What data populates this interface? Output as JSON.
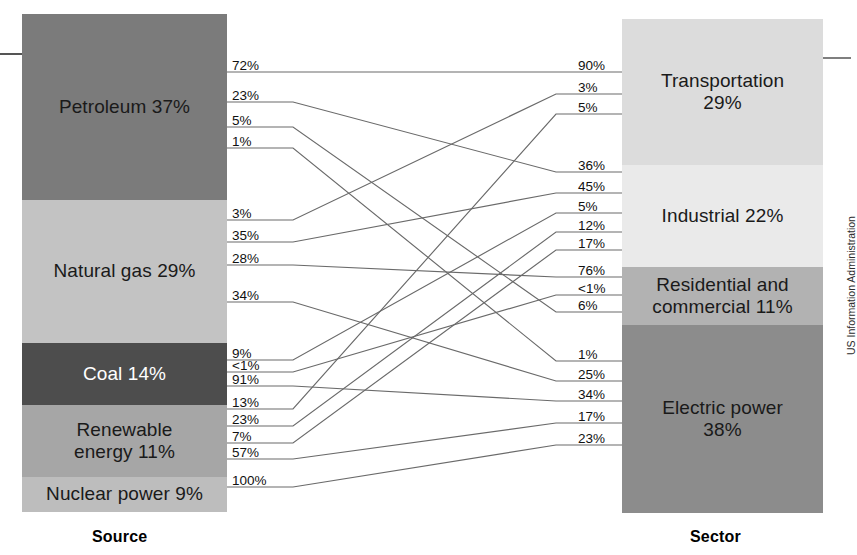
{
  "figure": {
    "source_caption": "Source",
    "sector_caption": "Sector",
    "credit": "US Information Administration"
  },
  "chart_data": {
    "type": "sankey",
    "xlabel": "Source",
    "ylabel": "Sector",
    "legend_position": "none",
    "grid": false,
    "nodes_left": [
      {
        "id": "petroleum",
        "label": "Petroleum 37%",
        "value": 37,
        "color": "#7b7b7b",
        "text_color": "#1a1a1a"
      },
      {
        "id": "natural_gas",
        "label": "Natural gas 29%",
        "value": 29,
        "color": "#c3c3c3",
        "text_color": "#1a1a1a"
      },
      {
        "id": "coal",
        "label": "Coal 14%",
        "value": 14,
        "color": "#4d4d4d",
        "text_color": "#ffffff"
      },
      {
        "id": "renewable",
        "label": "Renewable\nenergy 11%",
        "value": 11,
        "color": "#a6a6a6",
        "text_color": "#1a1a1a"
      },
      {
        "id": "nuclear",
        "label": "Nuclear power 9%",
        "value": 9,
        "color": "#bdbdbd",
        "text_color": "#1a1a1a"
      }
    ],
    "nodes_right": [
      {
        "id": "transportation",
        "label": "Transportation\n29%",
        "value": 29,
        "color": "#dcdcdc",
        "text_color": "#1a1a1a"
      },
      {
        "id": "industrial",
        "label": "Industrial 22%",
        "value": 22,
        "color": "#eaeaea",
        "text_color": "#1a1a1a"
      },
      {
        "id": "residential",
        "label": "Residential and\ncommercial 11%",
        "value": 11,
        "color": "#b2b2b2",
        "text_color": "#1a1a1a"
      },
      {
        "id": "electric",
        "label": "Electric power\n38%",
        "value": 38,
        "color": "#8c8c8c",
        "text_color": "#1a1a1a"
      }
    ],
    "source_flow_labels": [
      {
        "key": "petroleum_transportation",
        "label": "72%"
      },
      {
        "key": "petroleum_industrial",
        "label": "23%"
      },
      {
        "key": "petroleum_residential",
        "label": "5%"
      },
      {
        "key": "petroleum_electric",
        "label": "1%"
      },
      {
        "key": "gas_transportation",
        "label": "3%"
      },
      {
        "key": "gas_industrial",
        "label": "35%"
      },
      {
        "key": "gas_residential",
        "label": "28%"
      },
      {
        "key": "gas_electric",
        "label": "34%"
      },
      {
        "key": "coal_industrial",
        "label": "9%"
      },
      {
        "key": "coal_residential",
        "label": "<1%"
      },
      {
        "key": "coal_electric",
        "label": "91%"
      },
      {
        "key": "renewable_transportation",
        "label": "13%"
      },
      {
        "key": "renewable_industrial",
        "label": "23%"
      },
      {
        "key": "renewable_residential",
        "label": "7%"
      },
      {
        "key": "renewable_electric",
        "label": "57%"
      },
      {
        "key": "nuclear_electric",
        "label": "100%"
      }
    ],
    "sector_flow_labels": [
      {
        "key": "transportation_petroleum",
        "label": "90%"
      },
      {
        "key": "transportation_gas",
        "label": "3%"
      },
      {
        "key": "transportation_renewable",
        "label": "5%"
      },
      {
        "key": "industrial_petroleum",
        "label": "36%"
      },
      {
        "key": "industrial_gas",
        "label": "45%"
      },
      {
        "key": "industrial_coal",
        "label": "5%"
      },
      {
        "key": "industrial_renewable",
        "label": "12%"
      },
      {
        "key": "industrial_electric_retail",
        "label": "17%"
      },
      {
        "key": "residential_gas",
        "label": "76%"
      },
      {
        "key": "residential_coal",
        "label": "<1%"
      },
      {
        "key": "residential_petroleum",
        "label": "6%"
      },
      {
        "key": "electric_petroleum",
        "label": "1%"
      },
      {
        "key": "electric_gas",
        "label": "25%"
      },
      {
        "key": "electric_coal",
        "label": "34%"
      },
      {
        "key": "electric_renewable",
        "label": "17%"
      },
      {
        "key": "electric_nuclear",
        "label": "23%"
      }
    ],
    "flows": [
      {
        "from": "petroleum",
        "to": "transportation",
        "share_of_source": 72,
        "share_of_sector": 90
      },
      {
        "from": "petroleum",
        "to": "industrial",
        "share_of_source": 23,
        "share_of_sector": 36
      },
      {
        "from": "petroleum",
        "to": "residential",
        "share_of_source": 5,
        "share_of_sector": 6
      },
      {
        "from": "petroleum",
        "to": "electric",
        "share_of_source": 1,
        "share_of_sector": 1
      },
      {
        "from": "natural_gas",
        "to": "transportation",
        "share_of_source": 3,
        "share_of_sector": 3
      },
      {
        "from": "natural_gas",
        "to": "industrial",
        "share_of_source": 35,
        "share_of_sector": 45
      },
      {
        "from": "natural_gas",
        "to": "residential",
        "share_of_source": 28,
        "share_of_sector": 76
      },
      {
        "from": "natural_gas",
        "to": "electric",
        "share_of_source": 34,
        "share_of_sector": 25
      },
      {
        "from": "coal",
        "to": "industrial",
        "share_of_source": 9,
        "share_of_sector": 5
      },
      {
        "from": "coal",
        "to": "residential",
        "share_of_source": 0.5,
        "share_of_sector": 0.5
      },
      {
        "from": "coal",
        "to": "electric",
        "share_of_source": 91,
        "share_of_sector": 34
      },
      {
        "from": "renewable",
        "to": "transportation",
        "share_of_source": 13,
        "share_of_sector": 5
      },
      {
        "from": "renewable",
        "to": "industrial",
        "share_of_source": 23,
        "share_of_sector": 12
      },
      {
        "from": "renewable",
        "to": "residential",
        "share_of_source": 7,
        "share_of_sector": 17
      },
      {
        "from": "renewable",
        "to": "electric",
        "share_of_source": 57,
        "share_of_sector": 17
      },
      {
        "from": "nuclear",
        "to": "electric",
        "share_of_source": 100,
        "share_of_sector": 23
      }
    ]
  },
  "geometry": {
    "left_col": {
      "x": 22,
      "y": 14,
      "w": 205,
      "h": 498
    },
    "right_col": {
      "x": 622,
      "y": 19,
      "w": 201,
      "h": 494
    },
    "left_segments": [
      {
        "top": 0,
        "height": 186
      },
      {
        "top": 186,
        "height": 143
      },
      {
        "top": 329,
        "height": 62
      },
      {
        "top": 391,
        "height": 72
      },
      {
        "top": 463,
        "height": 35
      }
    ],
    "right_segments": [
      {
        "top": 0,
        "height": 146
      },
      {
        "top": 146,
        "height": 102
      },
      {
        "top": 248,
        "height": 58
      },
      {
        "top": 306,
        "height": 188
      }
    ],
    "left_label_x": 232,
    "right_label_x": 578,
    "left_label_y": [
      70,
      100,
      125,
      146,
      218,
      240,
      263,
      300,
      358,
      370,
      384,
      407,
      424,
      441,
      457,
      485
    ],
    "right_label_y": [
      70,
      92,
      112,
      170,
      191,
      211,
      230,
      248,
      275,
      293,
      310,
      359,
      379,
      399,
      421,
      443
    ]
  }
}
